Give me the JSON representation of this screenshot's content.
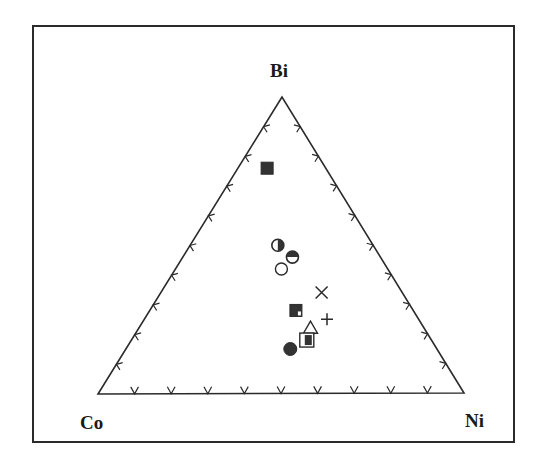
{
  "chart_data": {
    "type": "ternary-scatter",
    "title": "",
    "vertices": {
      "top": "Bi",
      "left": "Co",
      "right": "Ni"
    },
    "tick_interval_percent": 10,
    "grid": false,
    "legend": null,
    "points": [
      {
        "symbol": "filled-square",
        "Bi": 76,
        "Co": 16,
        "Ni": 8
      },
      {
        "symbol": "half-filled-circle-right",
        "Bi": 50,
        "Co": 26,
        "Ni": 24
      },
      {
        "symbol": "half-filled-circle-top",
        "Bi": 46,
        "Co": 24,
        "Ni": 30
      },
      {
        "symbol": "open-circle",
        "Bi": 42,
        "Co": 29,
        "Ni": 29
      },
      {
        "symbol": "cross-x",
        "Bi": 34,
        "Co": 22,
        "Ni": 44
      },
      {
        "symbol": "filled-square-notched",
        "Bi": 28,
        "Co": 32,
        "Ni": 40
      },
      {
        "symbol": "plus",
        "Bi": 25,
        "Co": 25,
        "Ni": 50
      },
      {
        "symbol": "open-triangle",
        "Bi": 22,
        "Co": 31,
        "Ni": 47
      },
      {
        "symbol": "square-with-inner-filled-square",
        "Bi": 18,
        "Co": 34,
        "Ni": 48
      },
      {
        "symbol": "filled-circle",
        "Bi": 15,
        "Co": 40,
        "Ni": 45
      }
    ]
  },
  "labels": {
    "top": "Bi",
    "left": "Co",
    "right": "Ni"
  },
  "colors": {
    "ink": "#2a2a2a",
    "fill": "#333333",
    "background": "#ffffff"
  }
}
